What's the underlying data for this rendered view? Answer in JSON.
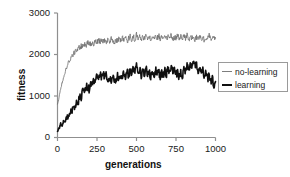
{
  "chart_data": {
    "type": "line",
    "title": "",
    "xlabel": "generations",
    "ylabel": "fitness",
    "xlim": [
      0,
      1000
    ],
    "ylim": [
      0,
      3000
    ],
    "grid": false,
    "legend_position": "right",
    "xticks": [
      "0",
      "250",
      "500",
      "750",
      "1000"
    ],
    "xtick_values": [
      0,
      250,
      500,
      750,
      1000
    ],
    "yticks": [
      "0",
      "1000",
      "2000",
      "3000"
    ],
    "ytick_values": [
      0,
      1000,
      2000,
      3000
    ],
    "series": [
      {
        "name": "no-learning",
        "color": "#6f6f6f",
        "width": 0.8,
        "x": [
          0,
          10,
          20,
          30,
          40,
          50,
          60,
          70,
          80,
          90,
          100,
          110,
          120,
          130,
          140,
          150,
          160,
          170,
          180,
          190,
          200,
          210,
          220,
          230,
          240,
          250,
          260,
          270,
          280,
          290,
          300,
          310,
          320,
          330,
          340,
          350,
          360,
          370,
          380,
          390,
          400,
          410,
          420,
          430,
          440,
          450,
          460,
          470,
          480,
          490,
          500,
          510,
          520,
          530,
          540,
          550,
          560,
          570,
          580,
          590,
          600,
          610,
          620,
          630,
          640,
          650,
          660,
          670,
          680,
          690,
          700,
          710,
          720,
          730,
          740,
          750,
          760,
          770,
          780,
          790,
          800,
          810,
          820,
          830,
          840,
          850,
          860,
          870,
          880,
          890,
          900,
          910,
          920,
          930,
          940,
          950,
          960,
          970,
          980,
          990,
          1000
        ],
        "values": [
          780,
          960,
          1180,
          1330,
          1480,
          1600,
          1700,
          1810,
          1880,
          1950,
          2010,
          2060,
          2100,
          2140,
          2180,
          2200,
          2230,
          2250,
          2190,
          2270,
          2290,
          2240,
          2310,
          2260,
          2330,
          2280,
          2350,
          2300,
          2360,
          2310,
          2370,
          2320,
          2380,
          2330,
          2390,
          2340,
          2270,
          2360,
          2300,
          2400,
          2330,
          2420,
          2350,
          2410,
          2300,
          2390,
          2440,
          2360,
          2430,
          2350,
          2480,
          2390,
          2450,
          2340,
          2420,
          2380,
          2460,
          2370,
          2440,
          2330,
          2410,
          2360,
          2450,
          2380,
          2470,
          2390,
          2430,
          2350,
          2420,
          2380,
          2460,
          2400,
          2480,
          2340,
          2420,
          2370,
          2490,
          2400,
          2460,
          2330,
          2440,
          2390,
          2470,
          2350,
          2430,
          2380,
          2450,
          2340,
          2420,
          2390,
          2470,
          2360,
          2440,
          2320,
          2400,
          2370,
          2450,
          2330,
          2410,
          2360,
          2390
        ]
      },
      {
        "name": "learning",
        "color": "#101010",
        "width": 1.6,
        "x": [
          0,
          10,
          20,
          30,
          40,
          50,
          60,
          70,
          80,
          90,
          100,
          110,
          120,
          130,
          140,
          150,
          160,
          170,
          180,
          190,
          200,
          210,
          220,
          230,
          240,
          250,
          260,
          270,
          280,
          290,
          300,
          310,
          320,
          330,
          340,
          350,
          360,
          370,
          380,
          390,
          400,
          410,
          420,
          430,
          440,
          450,
          460,
          470,
          480,
          490,
          500,
          510,
          520,
          530,
          540,
          550,
          560,
          570,
          580,
          590,
          600,
          610,
          620,
          630,
          640,
          650,
          660,
          670,
          680,
          690,
          700,
          710,
          720,
          730,
          740,
          750,
          760,
          770,
          780,
          790,
          800,
          810,
          820,
          830,
          840,
          850,
          860,
          870,
          880,
          890,
          900,
          910,
          920,
          930,
          940,
          950,
          960,
          970,
          980,
          990,
          1000
        ],
        "values": [
          150,
          210,
          330,
          280,
          420,
          370,
          520,
          480,
          640,
          600,
          760,
          700,
          880,
          830,
          1010,
          950,
          1120,
          1060,
          1190,
          1240,
          1160,
          1330,
          1270,
          1400,
          1330,
          1470,
          1410,
          1500,
          1430,
          1520,
          1460,
          1510,
          1380,
          1470,
          1400,
          1530,
          1410,
          1340,
          1480,
          1390,
          1520,
          1440,
          1570,
          1480,
          1600,
          1500,
          1620,
          1520,
          1680,
          1550,
          1710,
          1570,
          1640,
          1490,
          1600,
          1520,
          1650,
          1540,
          1600,
          1470,
          1570,
          1500,
          1630,
          1530,
          1590,
          1450,
          1560,
          1490,
          1640,
          1520,
          1690,
          1550,
          1760,
          1580,
          1650,
          1500,
          1590,
          1460,
          1570,
          1490,
          1640,
          1550,
          1730,
          1600,
          1810,
          1650,
          1880,
          1700,
          1790,
          1620,
          1700,
          1540,
          1610,
          1470,
          1550,
          1400,
          1490,
          1330,
          1430,
          1250,
          1350
        ]
      }
    ]
  },
  "axes": {
    "axis_color": "#8f8f8f",
    "tick_color": "#8f8f8f"
  },
  "legend": {
    "entries": [
      {
        "label": "no-learning",
        "style": "thin"
      },
      {
        "label": "learning",
        "style": "thick"
      }
    ]
  }
}
